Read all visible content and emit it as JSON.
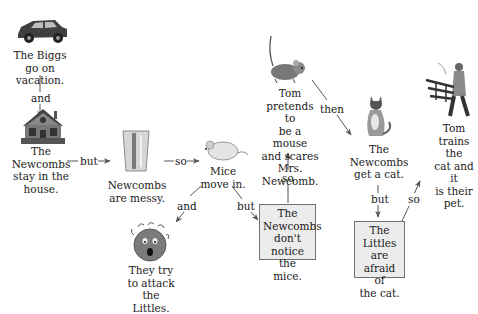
{
  "diagram": {
    "type": "story-map",
    "nodes": {
      "biggs_vacation": {
        "text": "The Biggs go on vacation.",
        "lines": [
          "The Biggs",
          "go on",
          "vacation."
        ],
        "icon": "car-icon"
      },
      "newcombs_stay": {
        "text": "The Newcombs stay in the house.",
        "lines": [
          "The",
          "Newcombs",
          "stay in the",
          "house."
        ],
        "icon": "house-icon"
      },
      "newcombs_messy": {
        "text": "Newcombs are messy.",
        "lines": [
          "Newcombs",
          "are messy."
        ],
        "icon": "trash-can-icon"
      },
      "mice_move_in": {
        "text": "Mice move in.",
        "lines": [
          "Mice",
          "move in."
        ],
        "icon": "mouse-icon"
      },
      "attack_littles": {
        "text": "They try to attack the Littles.",
        "lines": [
          "They try",
          "to attack",
          "the Littles."
        ],
        "icon": "scared-face-icon"
      },
      "dont_notice": {
        "text": "The Newcombs don't notice the mice.",
        "lines": [
          "The",
          "Newcombs",
          "don't notice",
          "the mice."
        ],
        "boxed": true
      },
      "tom_pretends": {
        "text": "Tom pretends to be a mouse and scares Mrs. Newcomb.",
        "lines": [
          "Tom",
          "pretends to",
          "be a mouse",
          "and scares",
          "Mrs.",
          "Newcomb."
        ],
        "icon": "mouse-icon"
      },
      "get_cat": {
        "text": "The Newcombs get a cat.",
        "lines": [
          "The",
          "Newcombs",
          "get a cat."
        ],
        "icon": "cat-icon"
      },
      "littles_afraid": {
        "text": "The Littles are afraid of the cat.",
        "lines": [
          "The",
          "Littles are",
          "afraid of",
          "the cat."
        ],
        "boxed": true
      },
      "tom_trains": {
        "text": "Tom trains the cat and it is their pet.",
        "lines": [
          "Tom",
          "trains the",
          "cat and it",
          "is their",
          "pet."
        ],
        "icon": "trainer-icon"
      }
    },
    "edges": [
      {
        "from": "biggs_vacation",
        "to": "newcombs_stay",
        "label": "and"
      },
      {
        "from": "newcombs_stay",
        "to": "newcombs_messy",
        "label": "but"
      },
      {
        "from": "newcombs_messy",
        "to": "mice_move_in",
        "label": "so"
      },
      {
        "from": "mice_move_in",
        "to": "attack_littles",
        "label": "and"
      },
      {
        "from": "mice_move_in",
        "to": "dont_notice",
        "label": "but"
      },
      {
        "from": "dont_notice",
        "to": "tom_pretends",
        "label": "so"
      },
      {
        "from": "tom_pretends",
        "to": "get_cat",
        "label": "then"
      },
      {
        "from": "get_cat",
        "to": "littles_afraid",
        "label": "but"
      },
      {
        "from": "littles_afraid",
        "to": "tom_trains",
        "label": "so"
      }
    ]
  }
}
